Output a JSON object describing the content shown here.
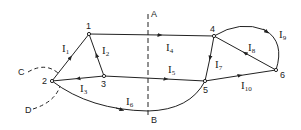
{
  "diagram": {
    "nodes": [
      {
        "id": "1",
        "x": 89,
        "y": 34
      },
      {
        "id": "2",
        "x": 52,
        "y": 81
      },
      {
        "id": "3",
        "x": 104,
        "y": 76
      },
      {
        "id": "4",
        "x": 214,
        "y": 36
      },
      {
        "id": "5",
        "x": 205,
        "y": 81
      },
      {
        "id": "6",
        "x": 276,
        "y": 70
      }
    ],
    "currents": [
      {
        "name": "I",
        "sub": "1",
        "from": "2",
        "to": "1"
      },
      {
        "name": "I",
        "sub": "2",
        "from": "3",
        "to": "1"
      },
      {
        "name": "I",
        "sub": "3",
        "from": "3",
        "to": "2"
      },
      {
        "name": "I",
        "sub": "4",
        "from": "1",
        "to": "4"
      },
      {
        "name": "I",
        "sub": "5",
        "from": "2",
        "to": "5"
      },
      {
        "name": "I",
        "sub": "6",
        "from": "2",
        "to": "5"
      },
      {
        "name": "I",
        "sub": "7",
        "from": "4",
        "to": "5"
      },
      {
        "name": "I",
        "sub": "8",
        "from": "6",
        "to": "4"
      },
      {
        "name": "I",
        "sub": "9",
        "from": "4",
        "to": "6"
      },
      {
        "name": "I",
        "sub": "10",
        "from": "5",
        "to": "6"
      }
    ],
    "cut_line": {
      "top_label": "A",
      "bottom_label": "B"
    },
    "surface_labels": {
      "c": "C",
      "d": "D"
    },
    "line_color": "#222222"
  }
}
